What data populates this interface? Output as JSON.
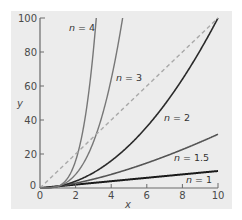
{
  "chart_data": {
    "type": "line",
    "title": "",
    "xlabel": "x",
    "ylabel": "y",
    "xlim": [
      0,
      10
    ],
    "ylim": [
      0,
      100
    ],
    "xticks": [
      0,
      2,
      4,
      6,
      8,
      10
    ],
    "yticks": [
      0,
      20,
      40,
      60,
      80,
      100
    ],
    "grid": false,
    "legend": "inline labels",
    "series": [
      {
        "name": "n = 1",
        "n": 1,
        "formula": "y = x^1",
        "color": "#1a1a1a",
        "width": 2.0,
        "label_pos": [
          7.9,
          7
        ]
      },
      {
        "name": "n = 1.5",
        "n": 1.5,
        "formula": "y = x^1.5",
        "color": "#555555",
        "width": 1.6,
        "label_pos": [
          7.0,
          26
        ]
      },
      {
        "name": "n = 2",
        "n": 2,
        "formula": "y = x^2",
        "color": "#2a2a2a",
        "width": 1.6,
        "label_pos": [
          6.7,
          55
        ]
      },
      {
        "name": "n = 3",
        "n": 3,
        "formula": "y = x^3",
        "color": "#777777",
        "width": 1.4,
        "label_pos": [
          4.4,
          65
        ]
      },
      {
        "name": "n = 4",
        "n": 4,
        "formula": "y = x^4",
        "color": "#777777",
        "width": 1.4,
        "label_pos": [
          1.5,
          94
        ]
      },
      {
        "name": "reference",
        "n": null,
        "formula": "y = 10x",
        "color": "#a8a8a8",
        "width": 1.4,
        "dashed": true
      }
    ]
  },
  "labels": {
    "n_prefix": "n",
    "n1": " = 1",
    "n15": " = 1.5",
    "n2": " = 2",
    "n3": " = 3",
    "n4": " = 4",
    "x_axis": "x",
    "y_axis": "y",
    "xt0": "0",
    "xt2": "2",
    "xt4": "4",
    "xt6": "6",
    "xt8": "8",
    "xt10": "10",
    "yt0": "0",
    "yt20": "20",
    "yt40": "40",
    "yt60": "60",
    "yt80": "80",
    "yt100": "100"
  }
}
